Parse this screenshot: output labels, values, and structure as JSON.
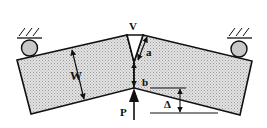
{
  "diagram": {
    "type": "three-point bend specimen with V-notch",
    "labels": {
      "notch": "V",
      "width": "W",
      "notch_depth": "a",
      "ligament": "b",
      "load": "P",
      "deflection": "Δ"
    },
    "colors": {
      "fill": "#d4d4d4",
      "stroke": "#111111",
      "roller": "#c8c8c8"
    },
    "components": [
      "left-half-beam",
      "right-half-beam",
      "left-roller-support",
      "right-roller-support",
      "load-arrow",
      "deflection-indicator"
    ]
  }
}
